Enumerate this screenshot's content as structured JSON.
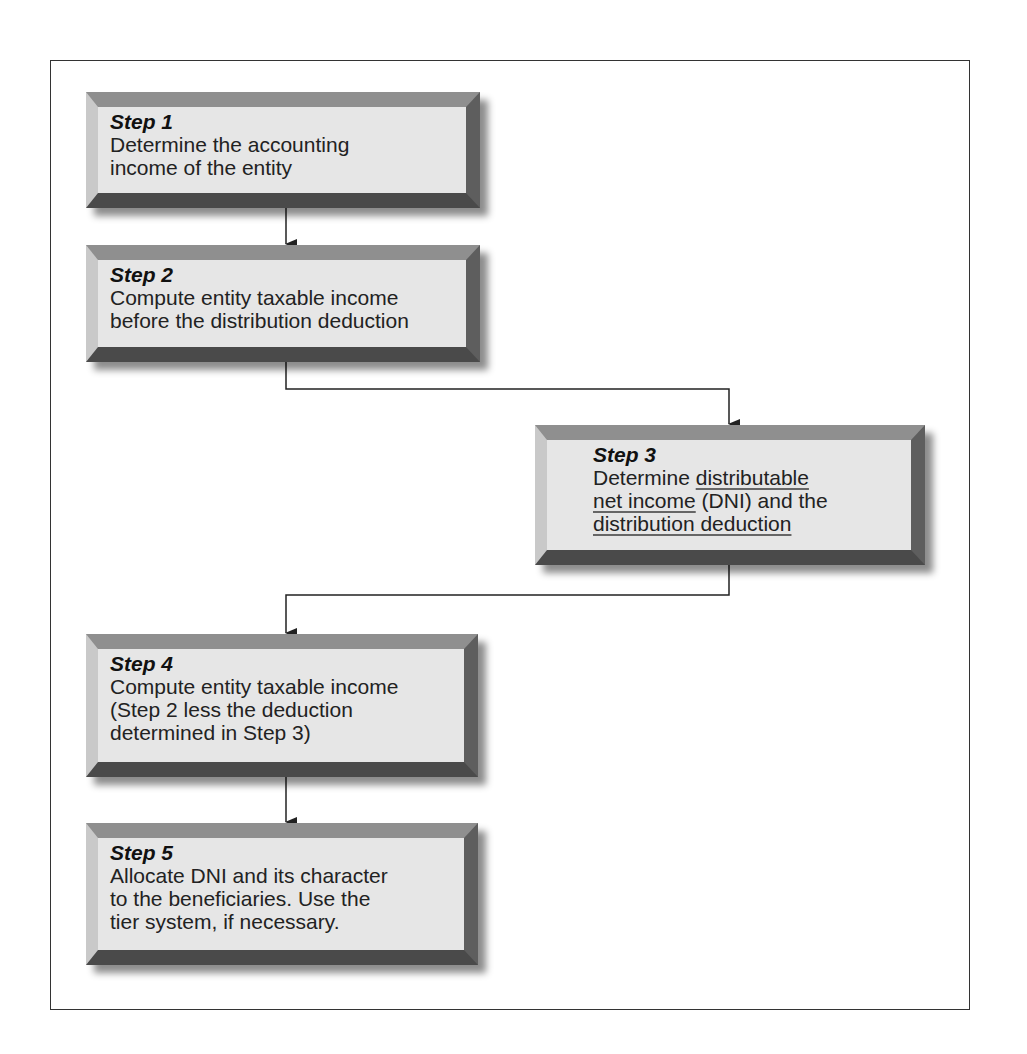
{
  "diagram": {
    "type": "flowchart",
    "steps": [
      {
        "title": "Step 1",
        "lines": [
          "Determine the accounting",
          "income of the entity"
        ]
      },
      {
        "title": "Step 2",
        "lines": [
          "Compute entity taxable income",
          "before the distribution deduction"
        ]
      },
      {
        "title": "Step 3",
        "lines_rich": [
          [
            {
              "t": "Determine "
            },
            {
              "t": "distributable",
              "u": true
            }
          ],
          [
            {
              "t": "net income",
              "u": true
            },
            {
              "t": " (DNI) and the"
            }
          ],
          [
            {
              "t": "distribution deduction",
              "u": true
            }
          ]
        ],
        "annotation": "handwritten underlines on key terms"
      },
      {
        "title": "Step 4",
        "lines": [
          "Compute entity taxable income",
          "(Step 2 less the deduction",
          "determined in Step 3)"
        ]
      },
      {
        "title": "Step 5",
        "lines": [
          "Allocate DNI and its character",
          "to the beneficiaries. Use the",
          "tier system, if necessary."
        ]
      }
    ],
    "edges": [
      {
        "from": "Step 1",
        "to": "Step 2"
      },
      {
        "from": "Step 2",
        "to": "Step 3"
      },
      {
        "from": "Step 3",
        "to": "Step 4"
      },
      {
        "from": "Step 4",
        "to": "Step 5"
      }
    ]
  }
}
